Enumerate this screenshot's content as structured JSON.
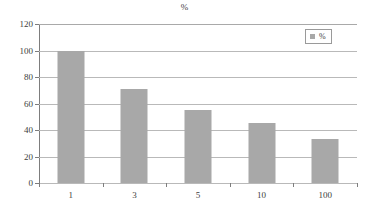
{
  "chart_data": {
    "type": "bar",
    "title": "%",
    "xlabel": "",
    "ylabel": "",
    "categories": [
      "1",
      "3",
      "5",
      "10",
      "100"
    ],
    "values": [
      100,
      71,
      55,
      45,
      33
    ],
    "series": [
      {
        "name": "%",
        "values": [
          100,
          71,
          55,
          45,
          33
        ]
      }
    ],
    "ylim": [
      0,
      120
    ],
    "yticks": [
      0,
      20,
      40,
      60,
      80,
      100,
      120
    ],
    "ytick_labels": [
      "0",
      "20",
      "40",
      "60",
      "80",
      "100",
      "120"
    ],
    "grid": true,
    "legend": {
      "position": "top-right",
      "entries": [
        {
          "label": "%",
          "color": "#a8a8a8",
          "marker": "square-swatch"
        }
      ]
    },
    "colors": {
      "bar": "#a8a8a8",
      "gridline": "#b9b9b9",
      "axis": "#7d7d7d",
      "text": "#3d3d3d",
      "background": "#ffffff"
    }
  }
}
